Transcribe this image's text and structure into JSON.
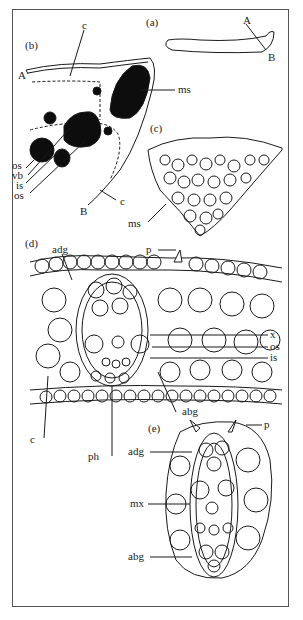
{
  "figure": {
    "panels": {
      "a": "(a)",
      "b": "(b)",
      "c": "(c)",
      "d": "(d)",
      "e": "(e)"
    },
    "labels": {
      "a_A": "A",
      "a_B": "B",
      "b_A": "A",
      "b_B": "B",
      "b_c_top": "c",
      "b_ms": "ms",
      "b_os1": "os",
      "b_vb": "vb",
      "b_is": "is",
      "b_os2": "os",
      "b_c_bottom": "c",
      "c_ms": "ms",
      "d_adg": "adg",
      "d_p": "p",
      "d_x": "x",
      "d_os": "os",
      "d_is": "is",
      "d_abg": "abg",
      "d_c": "c",
      "d_ph": "ph",
      "e_p": "p",
      "e_adg": "adg",
      "e_mx": "mx",
      "e_abg": "abg"
    },
    "colors": {
      "line": "#1a1a1a",
      "fill_dark": "#0d0d0d",
      "background": "#ffffff"
    }
  }
}
